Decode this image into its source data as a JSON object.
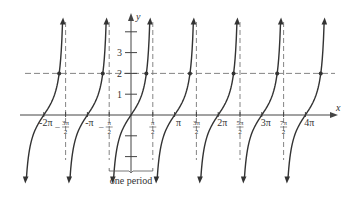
{
  "chart_data": {
    "type": "line",
    "title": "",
    "function": "y = tan x",
    "xlabel": "x",
    "ylabel": "y",
    "x_tick_labels": [
      "-2π",
      "-3π/2",
      "-π",
      "-π/2",
      "π/2",
      "π",
      "3π/2",
      "2π",
      "5π/2",
      "3π",
      "7π/2",
      "4π"
    ],
    "x_ticks_multiples_of_pi": [
      -2,
      -1.5,
      -1,
      -0.5,
      0.5,
      1,
      1.5,
      2,
      2.5,
      3,
      3.5,
      4
    ],
    "y_tick_labels": [
      "1",
      "2",
      "3"
    ],
    "y_ticks": [
      -2,
      -1,
      1,
      2,
      3,
      4
    ],
    "asymptotes_multiples_of_pi": [
      -1.5,
      -0.5,
      0.5,
      1.5,
      2.5,
      3.5
    ],
    "zeros_multiples_of_pi": [
      -2,
      -1,
      0,
      1,
      2,
      3,
      4
    ],
    "horizontal_reference_line": 2,
    "marked_points": [
      {
        "x_rad": -5.176,
        "y": 2
      },
      {
        "x_rad": -2.034,
        "y": 2
      },
      {
        "x_rad": 1.107,
        "y": 2
      },
      {
        "x_rad": 4.249,
        "y": 2
      },
      {
        "x_rad": 7.39,
        "y": 2
      },
      {
        "x_rad": 10.532,
        "y": 2
      },
      {
        "x_rad": 13.673,
        "y": 2
      }
    ],
    "annotation": "one period",
    "annotation_span_multiples_of_pi": [
      -0.5,
      0.5
    ],
    "xlim_multiples_of_pi": [
      -2.6,
      4.5
    ],
    "ylim": [
      -3.0,
      4.4
    ],
    "grid": false,
    "legend": null
  },
  "labels": {
    "x_axis": "x",
    "y_axis": "y",
    "y1": "1",
    "y2": "2",
    "y3": "3",
    "annotation": "one period"
  },
  "colors": {
    "curve": "#333333",
    "axis": "#444444",
    "dashed": "#777777"
  }
}
